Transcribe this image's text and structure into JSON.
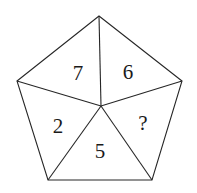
{
  "figure": {
    "shape": "pentagon",
    "background_color": "#ffffff",
    "stroke_color": "#262626",
    "stroke_width": 1.1,
    "text_color": "#1a1a1a",
    "canvas": {
      "width": 197,
      "height": 193
    },
    "vertices": [
      {
        "name": "top",
        "x": 99,
        "y": 16
      },
      {
        "name": "right",
        "x": 182,
        "y": 81
      },
      {
        "name": "bottom-right",
        "x": 152,
        "y": 180
      },
      {
        "name": "bottom-left",
        "x": 48,
        "y": 180
      },
      {
        "name": "left",
        "x": 17,
        "y": 81
      }
    ],
    "center": {
      "name": "center",
      "x": 101,
      "y": 106
    },
    "outline_points": "99,16 182,81 152,180 48,180 17,81",
    "spokes": [
      {
        "name": "spoke-to-top",
        "x1": 101,
        "y1": 106,
        "x2": 99,
        "y2": 16
      },
      {
        "name": "spoke-to-right",
        "x1": 101,
        "y1": 106,
        "x2": 182,
        "y2": 81
      },
      {
        "name": "spoke-to-bottom-right",
        "x1": 101,
        "y1": 106,
        "x2": 152,
        "y2": 180
      },
      {
        "name": "spoke-to-bottom-left",
        "x1": 101,
        "y1": 106,
        "x2": 48,
        "y2": 180
      },
      {
        "name": "spoke-to-left",
        "x1": 101,
        "y1": 106,
        "x2": 17,
        "y2": 81
      }
    ],
    "sectors": [
      {
        "id": "top-left",
        "label": "7",
        "x": 78,
        "y": 73,
        "font_size": 21
      },
      {
        "id": "top-right",
        "label": "6",
        "x": 128,
        "y": 72,
        "font_size": 21
      },
      {
        "id": "right",
        "label": "?",
        "x": 143,
        "y": 123,
        "font_size": 21
      },
      {
        "id": "bottom",
        "label": "5",
        "x": 100,
        "y": 151,
        "font_size": 21
      },
      {
        "id": "left",
        "label": "2",
        "x": 58,
        "y": 126,
        "font_size": 21
      }
    ]
  },
  "chart_data": {
    "type": "diagram",
    "categories": [
      "top-left",
      "top-right",
      "right",
      "bottom",
      "left"
    ],
    "values": [
      7,
      6,
      null,
      5,
      2
    ],
    "labels": [
      "7",
      "6",
      "?",
      "5",
      "2"
    ],
    "unknown_sector": "right",
    "xlabel": "",
    "ylabel": ""
  }
}
